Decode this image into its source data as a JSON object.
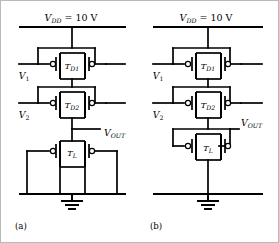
{
  "figure": {
    "type": "circuit-schematic",
    "technology": "PMOS enhancement/depletion logic gate",
    "background_color": "#ffffff",
    "line_color": "#000000",
    "frame_color": "#b9b9b9"
  },
  "circuits": [
    {
      "id": "a",
      "caption": "(a)",
      "supply": {
        "symbol": "V",
        "subscript": "DD",
        "equals": " = 10 V",
        "full_text": "VDD = 10 V"
      },
      "inputs": [
        {
          "symbol": "V",
          "subscript": "1",
          "full_text": "V1"
        },
        {
          "symbol": "V",
          "subscript": "2",
          "full_text": "V2"
        }
      ],
      "output": {
        "symbol": "V",
        "subscript": "OUT",
        "full_text": "VOUT"
      },
      "transistors": [
        {
          "symbol": "T",
          "subscript": "D1",
          "full_text": "TD1",
          "role": "driver"
        },
        {
          "symbol": "T",
          "subscript": "D2",
          "full_text": "TD2",
          "role": "driver"
        },
        {
          "symbol": "T",
          "subscript": "L",
          "full_text": "TL",
          "role": "load"
        }
      ],
      "ground": {
        "label": "",
        "symbol": "earth-ground"
      }
    },
    {
      "id": "b",
      "caption": "(b)",
      "supply": {
        "symbol": "V",
        "subscript": "DD",
        "equals": " = 10 V",
        "full_text": "VDD = 10 V"
      },
      "inputs": [
        {
          "symbol": "V",
          "subscript": "1",
          "full_text": "V1"
        },
        {
          "symbol": "V",
          "subscript": "2",
          "full_text": "V2"
        }
      ],
      "output": {
        "symbol": "V",
        "subscript": "OUT",
        "full_text": "VOUT"
      },
      "transistors": [
        {
          "symbol": "T",
          "subscript": "D1",
          "full_text": "TD1",
          "role": "driver"
        },
        {
          "symbol": "T",
          "subscript": "D2",
          "full_text": "TD2",
          "role": "driver"
        },
        {
          "symbol": "T",
          "subscript": "L",
          "full_text": "TL",
          "role": "load"
        }
      ],
      "ground": {
        "label": "",
        "symbol": "earth-ground"
      }
    }
  ]
}
